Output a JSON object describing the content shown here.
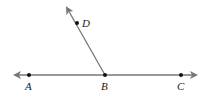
{
  "diagram": {
    "type": "geometry-rays",
    "line": {
      "from": [
        15,
        75
      ],
      "to": [
        196,
        75
      ],
      "arrows": "both"
    },
    "ray": {
      "from": [
        105,
        75
      ],
      "to": [
        67,
        8
      ],
      "arrow": "end"
    },
    "points": [
      {
        "label": "A",
        "x": 29,
        "y": 75
      },
      {
        "label": "B",
        "x": 105,
        "y": 75
      },
      {
        "label": "C",
        "x": 181,
        "y": 75
      },
      {
        "label": "D",
        "x": 77,
        "y": 23
      }
    ],
    "colors": {
      "line": "#777777",
      "point": "#111111",
      "label": "#222222"
    }
  }
}
